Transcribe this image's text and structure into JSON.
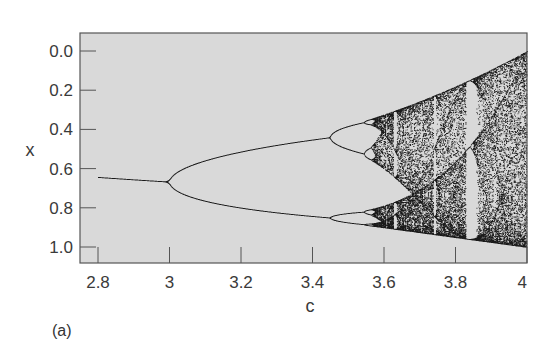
{
  "figure": {
    "panel_label": "(a)"
  },
  "chart_data": {
    "type": "scatter",
    "title": "",
    "xlabel": "c",
    "ylabel": "x",
    "xlim": [
      2.75,
      4.0
    ],
    "ylim": [
      0.0,
      1.0
    ],
    "y_inverted": true,
    "x_ticks": [
      2.8,
      3.0,
      3.2,
      3.4,
      3.6,
      3.8,
      4.0
    ],
    "x_tick_labels": [
      "2.8",
      "3",
      "3.2",
      "3.4",
      "3.6",
      "3.8",
      "4"
    ],
    "y_ticks": [
      0.0,
      0.2,
      0.4,
      0.6,
      0.8,
      1.0
    ],
    "y_tick_labels": [
      "0.0",
      "0.2",
      "0.4",
      "0.6",
      "0.8",
      "1.0"
    ],
    "grid": false,
    "legend": null,
    "map": "logistic",
    "c_start": 2.8,
    "c_end": 4.0,
    "c_steps": 900,
    "transient_iterations": 300,
    "plotted_iterations": 60,
    "initial_x": 0.5,
    "key_points": [
      {
        "c": 2.8,
        "x": [
          0.643
        ]
      },
      {
        "c": 3.0,
        "x": [
          0.667
        ]
      },
      {
        "c": 3.2,
        "x": [
          0.513,
          0.799
        ]
      },
      {
        "c": 3.449,
        "x": [
          0.44,
          0.85
        ],
        "note": "period-4 onset"
      },
      {
        "c": 3.5,
        "x": [
          0.383,
          0.501,
          0.827,
          0.875
        ]
      },
      {
        "c": 3.57,
        "note": "onset of chaos"
      },
      {
        "c": 3.83,
        "x": [
          0.156,
          0.505,
          0.957
        ],
        "note": "period-3 window"
      },
      {
        "c": 4.0,
        "x_range": [
          0.0,
          1.0
        ]
      }
    ],
    "colors": {
      "background": "#d9d9d9",
      "points": "#1a1a1a",
      "frame": "#555555"
    }
  }
}
